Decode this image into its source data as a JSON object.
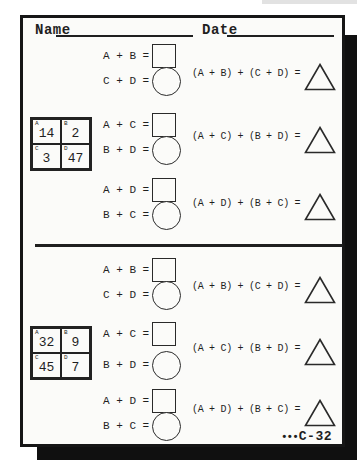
{
  "header": {
    "name_label": "Name",
    "date_label": "Date"
  },
  "footer": {
    "dots": "•••",
    "code": "C-32"
  },
  "colors": {
    "ink": "#1f1f1f",
    "paper": "#fbfbf9",
    "shadow": "#101010"
  },
  "sections": [
    {
      "grid": {
        "cells": [
          {
            "letter": "A",
            "value": "14"
          },
          {
            "letter": "B",
            "value": "2"
          },
          {
            "letter": "C",
            "value": "3"
          },
          {
            "letter": "D",
            "value": "47"
          }
        ]
      },
      "rows": [
        {
          "eq1": "A + B =",
          "eq2": "C + D =",
          "combined": "(A + B) + (C + D) ="
        },
        {
          "eq1": "A + C =",
          "eq2": "B + D =",
          "combined": "(A + C) + (B + D) ="
        },
        {
          "eq1": "A + D =",
          "eq2": "B + C =",
          "combined": "(A + D) + (B + C) ="
        }
      ]
    },
    {
      "grid": {
        "cells": [
          {
            "letter": "A",
            "value": "32"
          },
          {
            "letter": "B",
            "value": "9"
          },
          {
            "letter": "C",
            "value": "45"
          },
          {
            "letter": "D",
            "value": "7"
          }
        ]
      },
      "rows": [
        {
          "eq1": "A + B =",
          "eq2": "C + D =",
          "combined": "(A + B) + (C + D) ="
        },
        {
          "eq1": "A + C =",
          "eq2": "B + D =",
          "combined": "(A + C) + (B + D) ="
        },
        {
          "eq1": "A + D =",
          "eq2": "B + C =",
          "combined": "(A + D) + (B + C) ="
        }
      ]
    }
  ]
}
